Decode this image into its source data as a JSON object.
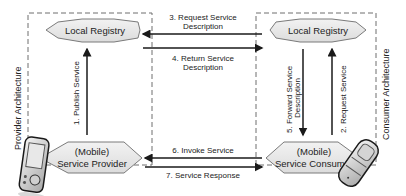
{
  "provider": {
    "architecture_label": "Provider Architecture",
    "registry_label": "Local Registry",
    "service_label_line1": "(Mobile)",
    "service_label_line2": "Service Provider",
    "device_icon": "pda-icon"
  },
  "consumer": {
    "architecture_label": "Consumer Architecture",
    "registry_label": "Local Registry",
    "service_label_line1": "(Mobile)",
    "service_label_line2": "Service Consumer",
    "device_icon": "mobile-phone-icon"
  },
  "steps": [
    {
      "id": 1,
      "line1": "1. Publish Service",
      "line2": ""
    },
    {
      "id": 2,
      "line1": "2. Request Service",
      "line2": ""
    },
    {
      "id": 3,
      "line1": "3. Request Service",
      "line2": "Description"
    },
    {
      "id": 4,
      "line1": "4. Return Service",
      "line2": "Description"
    },
    {
      "id": 5,
      "line1": "5. Forward Service",
      "line2": "Description"
    },
    {
      "id": 6,
      "line1": "6. Invoke Service",
      "line2": ""
    },
    {
      "id": 7,
      "line1": "7. Service Response",
      "line2": ""
    }
  ],
  "colors": {
    "box_fill": "#e6e6e6",
    "box_stroke": "#7a7a7a",
    "dash": "#6e6e6e",
    "arrow": "#1a1a1a"
  }
}
